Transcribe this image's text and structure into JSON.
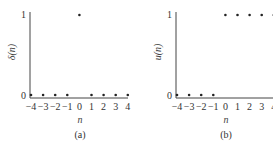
{
  "chart_data": [
    {
      "type": "scatter",
      "title": "",
      "caption": "(a)",
      "xlabel": "n",
      "ylabel": "δ(n)",
      "x": [
        -4,
        -3,
        -2,
        -1,
        0,
        1,
        2,
        3,
        4
      ],
      "values": [
        0,
        0,
        0,
        0,
        1,
        0,
        0,
        0,
        0
      ],
      "xticks": [
        "−4",
        "−3",
        "−2",
        "−1",
        "0",
        "1",
        "2",
        "3",
        "4"
      ],
      "yticks": [
        "0",
        "1"
      ],
      "ylim": [
        0,
        1
      ],
      "grid": false
    },
    {
      "type": "scatter",
      "title": "",
      "caption": "(b)",
      "xlabel": "n",
      "ylabel": "u(n)",
      "x": [
        -4,
        -3,
        -2,
        -1,
        0,
        1,
        2,
        3,
        4
      ],
      "values": [
        0,
        0,
        0,
        0,
        1,
        1,
        1,
        1,
        1
      ],
      "xticks": [
        "−4",
        "−3",
        "−2",
        "−1",
        "0",
        "1",
        "2",
        "3",
        "4"
      ],
      "yticks": [
        "0",
        "1"
      ],
      "ylim": [
        0,
        1
      ],
      "grid": false
    }
  ],
  "labels": {
    "a": {
      "caption": "(a)",
      "xlabel": "n",
      "ylabel": "δ(n)",
      "y0": "0",
      "y1": "1"
    },
    "b": {
      "caption": "(b)",
      "xlabel": "n",
      "ylabel": "u(n)",
      "y0": "0",
      "y1": "1"
    }
  }
}
